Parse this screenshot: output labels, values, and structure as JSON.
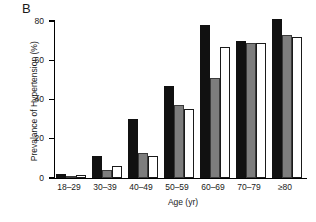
{
  "panel": {
    "letter": "B"
  },
  "chart_data": {
    "type": "bar",
    "title": "",
    "xlabel": "Age (yr)",
    "ylabel": "Prevalance of Hypertension (%)",
    "categories": [
      "18–29",
      "30–39",
      "40–49",
      "50–59",
      "60–69",
      "70–79",
      "≥80"
    ],
    "series": [
      {
        "name": "series-1-black",
        "color": "#111111",
        "values": [
          2,
          11,
          30,
          47,
          78,
          70,
          81
        ]
      },
      {
        "name": "series-2-gray",
        "color": "#7d7d7d",
        "values": [
          0.5,
          4,
          13,
          37,
          51,
          69,
          73
        ]
      },
      {
        "name": "series-3-white",
        "color": "#ffffff",
        "values": [
          1.5,
          6,
          11,
          35,
          67,
          69,
          72
        ]
      }
    ],
    "ylim": [
      0,
      80
    ],
    "yticks": [
      0,
      20,
      40,
      60,
      80
    ],
    "ytick_labels": [
      "0",
      "20",
      "40",
      "60",
      "80"
    ],
    "grid": false,
    "legend": "none"
  }
}
